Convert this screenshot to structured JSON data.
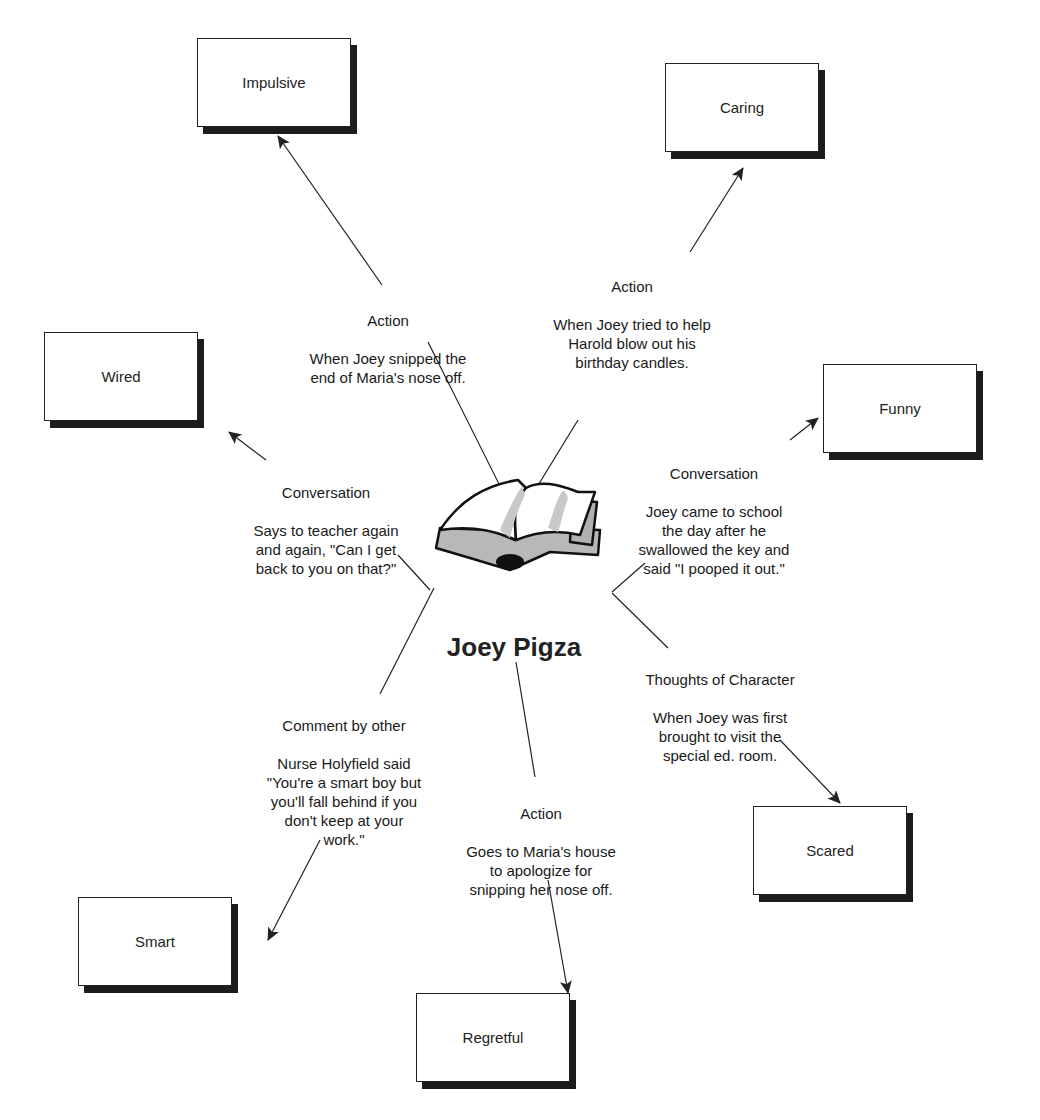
{
  "center": {
    "title": "Joey Pigza",
    "icon": "open-book-icon"
  },
  "traits": [
    {
      "id": "impulsive",
      "label": "Impulsive",
      "x": 197,
      "y": 38
    },
    {
      "id": "caring",
      "label": "Caring",
      "x": 665,
      "y": 63
    },
    {
      "id": "wired",
      "label": "Wired",
      "x": 44,
      "y": 332
    },
    {
      "id": "funny",
      "label": "Funny",
      "x": 823,
      "y": 364
    },
    {
      "id": "scared",
      "label": "Scared",
      "x": 753,
      "y": 806
    },
    {
      "id": "smart",
      "label": "Smart",
      "x": 78,
      "y": 897
    },
    {
      "id": "regretful",
      "label": "Regretful",
      "x": 416,
      "y": 993
    }
  ],
  "evidence": [
    {
      "trait": "impulsive",
      "type": "Action",
      "text": "When Joey snipped the\nend of Maria's nose off."
    },
    {
      "trait": "caring",
      "type": "Action",
      "text": "When Joey tried to help\nHarold blow out his\nbirthday candles."
    },
    {
      "trait": "wired",
      "type": "Conversation",
      "text": "Says to teacher again\nand again, \"Can I get\nback to you on that?\""
    },
    {
      "trait": "funny",
      "type": "Conversation",
      "text": "Joey came to school\nthe day after he\nswallowed the key and\nsaid \"I pooped it out.\""
    },
    {
      "trait": "scared",
      "type": "Thoughts of Character",
      "text": "When Joey was first\nbrought to visit the\nspecial ed. room."
    },
    {
      "trait": "smart",
      "type": "Comment by other",
      "text": "Nurse Holyfield said\n\"You're a smart boy but\nyou'll fall behind if you\ndon't keep at your\nwork.\""
    },
    {
      "trait": "regretful",
      "type": "Action",
      "text": "Goes to Maria's house\nto apologize for\nsnipping her nose off."
    }
  ],
  "colors": {
    "line": "#222222",
    "box_shadow": "#1c1c1c",
    "book_gray": "#b8b8b8",
    "background": "#ffffff"
  }
}
